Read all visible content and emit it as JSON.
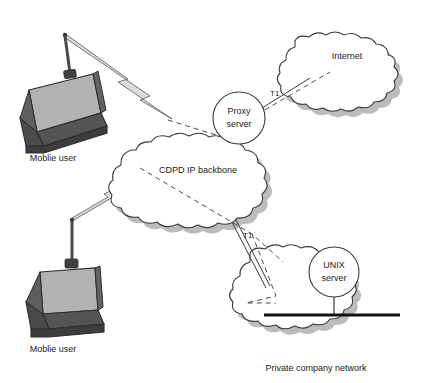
{
  "diagram": {
    "background_color": "#ffffff",
    "stroke_color": "#3a3a3a",
    "shadow_color": "#b9b9b9",
    "text_color": "#1a1a1a",
    "laptop_screen_color": "#b2b2b2",
    "laptop_body_color": "#4f4f4f",
    "laptop_edge_color": "#2e2e2e",
    "bolt_fill_color": "#d8d8d8",
    "bus_bar_color": "#111111"
  },
  "clouds": [
    {
      "id": "cdpd-backbone",
      "label": "CDPD IP backbone",
      "label_x": 198,
      "label_y": 171
    },
    {
      "id": "internet",
      "label": "Internet",
      "label_x": 347,
      "label_y": 57
    },
    {
      "id": "private-network",
      "label": "",
      "label_x": 0,
      "label_y": 0
    }
  ],
  "servers": [
    {
      "id": "proxy-server",
      "line1": "Proxy",
      "line2": "server",
      "cx": 239,
      "cy": 118,
      "r": 26
    },
    {
      "id": "unix-server",
      "line1": "UNIX",
      "line2": "server",
      "cx": 334,
      "cy": 272,
      "r": 25
    }
  ],
  "endpoints": [
    {
      "id": "mobile-user-top",
      "caption": "Moblie user",
      "caption_x": 53,
      "caption_y": 161
    },
    {
      "id": "mobile-user-bottom",
      "caption": "Moblie user",
      "caption_x": 53,
      "caption_y": 352
    }
  ],
  "captions": [
    {
      "id": "private-company-network",
      "text": "Private company network",
      "x": 316,
      "y": 371
    }
  ],
  "link_labels": [
    {
      "id": "t1-internet-link",
      "text": "T1",
      "x": 270,
      "y": 96
    },
    {
      "id": "t1-private-link",
      "text": "T1",
      "x": 243,
      "y": 238
    }
  ]
}
